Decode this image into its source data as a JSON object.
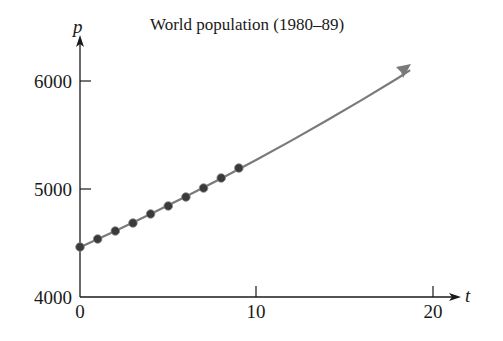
{
  "chart_data": {
    "type": "scatter",
    "title": "World population (1980–89)",
    "xlabel": "t",
    "ylabel": "p",
    "xlim": [
      0,
      21
    ],
    "ylim": [
      4000,
      6200
    ],
    "x_ticks": [
      0,
      10,
      20
    ],
    "x_tick_labels": [
      "0",
      "10",
      "20"
    ],
    "y_ticks": [
      4000,
      5000,
      6000
    ],
    "y_tick_labels": [
      "4000",
      "5000",
      "6000"
    ],
    "grid": false,
    "legend": null,
    "series": [
      {
        "name": "Population data",
        "kind": "points",
        "x": [
          0,
          1,
          2,
          3,
          4,
          5,
          6,
          7,
          8,
          9
        ],
        "y": [
          4463,
          4537,
          4611,
          4685,
          4769,
          4843,
          4926,
          5009,
          5102,
          5194
        ]
      },
      {
        "name": "Exponential model",
        "kind": "curve",
        "x": [
          0,
          2,
          4,
          6,
          8,
          10,
          12,
          14,
          16,
          18,
          18.7
        ],
        "y": [
          4460,
          4611,
          4768,
          4930,
          5098,
          5271,
          5450,
          5636,
          5828,
          6026,
          6100
        ]
      }
    ],
    "annotations": [
      {
        "text": "arrow marker at end of model curve",
        "x": 18.7,
        "y": 6100
      }
    ]
  }
}
